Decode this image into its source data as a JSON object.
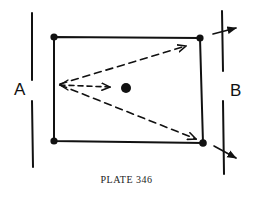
{
  "diagram": {
    "label_left": "A",
    "label_right": "B",
    "caption": "PLATE 346",
    "ink_color": "#111111",
    "background": "#ffffff"
  }
}
